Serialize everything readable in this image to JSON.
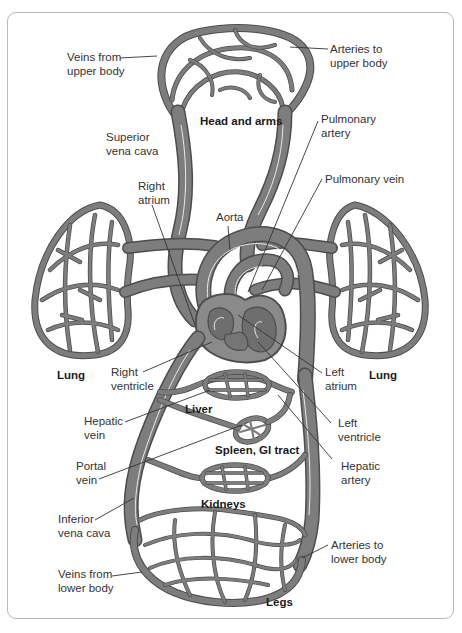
{
  "diagram": {
    "type": "anatomical-circulation",
    "colors": {
      "vessel": "#7d7d7d",
      "vessel_edge": "#4d4d4d",
      "frame": "#b8b8b8",
      "text": "#333333"
    },
    "region_labels": {
      "head_arms": "Head and arms",
      "lung_left": "Lung",
      "lung_right": "Lung",
      "liver": "Liver",
      "spleen_gi": "Spleen, GI tract",
      "kidneys": "Kidneys",
      "legs": "Legs"
    },
    "labels": {
      "veins_upper": "Veins from\nupper body",
      "arteries_upper": "Arteries to\nupper body",
      "superior_vena_cava": "Superior\nvena cava",
      "pulmonary_artery": "Pulmonary\nartery",
      "pulmonary_vein": "Pulmonary vein",
      "right_atrium": "Right\natrium",
      "aorta": "Aorta",
      "right_ventricle": "Right\nventricle",
      "left_atrium": "Left\natrium",
      "hepatic_vein": "Hepatic\nvein",
      "left_ventricle": "Left\nventricle",
      "portal_vein": "Portal\nvein",
      "hepatic_artery": "Hepatic\nartery",
      "inferior_vena_cava": "Inferior\nvena cava",
      "arteries_lower": "Arteries to\nlower body",
      "veins_lower": "Veins from\nlower body"
    }
  }
}
